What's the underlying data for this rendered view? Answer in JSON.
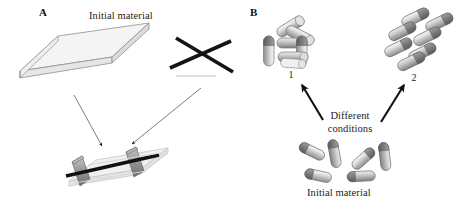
{
  "figure": {
    "width": 465,
    "height": 209,
    "background": "#ffffff",
    "type": "scientific-schematic-diagram"
  },
  "panels": {
    "a": {
      "label": "A",
      "initial_material_caption": "Initial material",
      "elements": {
        "plate_name": "rectangular-plate-slab",
        "crossed_rods_name": "crossed-black-rods",
        "composite_name": "layered-composite-assembly"
      },
      "arrows": [
        {
          "name": "arrow-plate-to-composite",
          "from": "plate",
          "to": "composite"
        },
        {
          "name": "arrow-rods-to-composite",
          "from": "crossed-rods",
          "to": "composite"
        }
      ]
    },
    "b": {
      "label": "B",
      "initial_material_caption": "Initial material",
      "conditions_caption_line1": "Different",
      "conditions_caption_line2": "conditions",
      "structures": [
        {
          "number": "1",
          "name": "square-ring-capsule-assembly"
        },
        {
          "number": "2",
          "name": "staggered-capsule-array"
        }
      ],
      "arrows": [
        {
          "name": "arrow-to-structure-1",
          "to": "1"
        },
        {
          "name": "arrow-to-structure-2",
          "to": "2"
        }
      ],
      "initial_capsule_count": 6
    }
  },
  "colors": {
    "outline": "#555555",
    "plate_fill": "#f2f2f2",
    "plate_edge": "#9a9a9a",
    "rod_black": "#111111",
    "rod_gray_dark": "#7a7a7a",
    "rod_gray_mid": "#a8a8a8",
    "rod_gray_light": "#d9d9d9",
    "capsule_light": "#efefef",
    "capsule_cap_dark": "#6e6e6e",
    "arrow_thin": "#6f6f6f",
    "arrow_thick": "#111111",
    "text": "#1b1b1b"
  }
}
